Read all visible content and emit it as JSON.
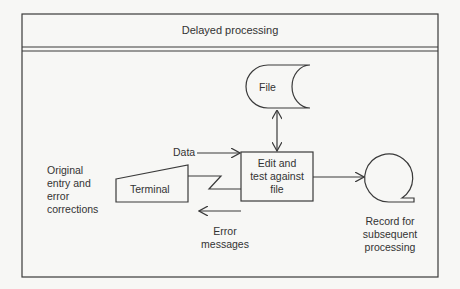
{
  "title": "Delayed processing",
  "nodes": {
    "file": {
      "label": "File",
      "shape": "stored-data"
    },
    "edit": {
      "label_lines": [
        "Edit and",
        "test against",
        "file"
      ],
      "shape": "process-box"
    },
    "terminal": {
      "label": "Terminal",
      "shape": "manual-input"
    },
    "tape": {
      "shape": "magnetic-tape"
    }
  },
  "annotations": {
    "data": "Data",
    "original_entry": [
      "Original",
      "entry and",
      "error",
      "corrections"
    ],
    "error_messages": [
      "Error",
      "messages"
    ],
    "record": [
      "Record for",
      "subsequent",
      "processing"
    ]
  },
  "edges": [
    {
      "from": "file",
      "to": "edit",
      "type": "bidirectional"
    },
    {
      "from": "data",
      "to": "edit",
      "label": "Data"
    },
    {
      "from": "terminal",
      "to": "edit",
      "type": "communication-link"
    },
    {
      "from": "edit",
      "to": "tape"
    },
    {
      "from": "edit",
      "to": "terminal",
      "label": "Error messages"
    }
  ],
  "colors": {
    "line": "#3a3a3a",
    "background": "#f7f7f5"
  }
}
